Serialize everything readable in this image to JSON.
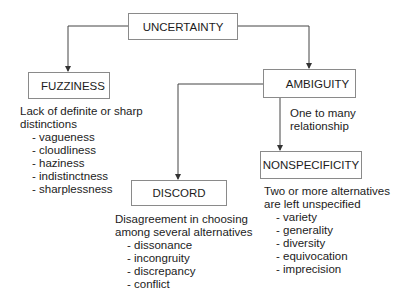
{
  "nodes": {
    "uncertainty": {
      "label": "UNCERTAINTY"
    },
    "fuzziness": {
      "label": "FUZZINESS",
      "description": [
        "Lack of definite or sharp",
        "distinctions"
      ],
      "items": [
        "- vagueness",
        "- cloudliness",
        "- haziness",
        "- indistinctness",
        "- sharplessness"
      ]
    },
    "ambiguity": {
      "label": "AMBIGUITY",
      "edge_label": [
        "One to many",
        "relationship"
      ]
    },
    "discord": {
      "label": "DISCORD",
      "description": [
        "Disagreement in choosing",
        "among several alternatives"
      ],
      "items": [
        "- dissonance",
        "- incongruity",
        "- discrepancy",
        "- conflict"
      ]
    },
    "nonspecificity": {
      "label": "NONSPECIFICITY",
      "description": [
        "Two or more alternatives",
        "are left unspecified"
      ],
      "items": [
        "- variety",
        "- generality",
        "- diversity",
        "- equivocation",
        "- imprecision"
      ]
    }
  },
  "edges": [
    {
      "from": "uncertainty",
      "to": "fuzziness"
    },
    {
      "from": "uncertainty",
      "to": "ambiguity"
    },
    {
      "from": "ambiguity",
      "to": "discord"
    },
    {
      "from": "ambiguity",
      "to": "nonspecificity"
    }
  ]
}
